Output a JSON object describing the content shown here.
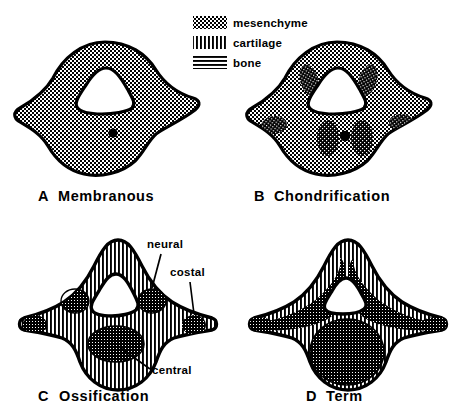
{
  "figure": {
    "background_color": "#ffffff",
    "ink_color": "#000000",
    "width": 467,
    "height": 419
  },
  "legend": {
    "items": [
      {
        "swatch": "checker-pattern-swatch",
        "label": "mesenchyme",
        "pattern": "mesenchyme"
      },
      {
        "swatch": "vertical-lines-swatch",
        "label": "cartilage",
        "pattern": "cartilage"
      },
      {
        "swatch": "horizontal-lines-swatch",
        "label": "bone",
        "pattern": "bone"
      }
    ]
  },
  "panels": [
    {
      "letter": "A",
      "caption": "Membranous",
      "fill": "mesenchyme",
      "features": [
        "neural-canal",
        "notochord-dot"
      ],
      "centers": []
    },
    {
      "letter": "B",
      "caption": "Chondrification",
      "fill": "mesenchyme",
      "features": [
        "neural-canal",
        "notochord-dot"
      ],
      "centers": [
        {
          "name": "neural",
          "side": "left"
        },
        {
          "name": "neural",
          "side": "right"
        },
        {
          "name": "costal",
          "side": "left"
        },
        {
          "name": "costal",
          "side": "right"
        },
        {
          "name": "central",
          "side": "mid"
        }
      ]
    },
    {
      "letter": "C",
      "caption": "Ossification",
      "fill": "cartilage",
      "features": [
        "neural-canal"
      ],
      "centers": [
        {
          "name": "neural",
          "side": "left"
        },
        {
          "name": "neural",
          "side": "right"
        },
        {
          "name": "costal",
          "side": "left"
        },
        {
          "name": "costal",
          "side": "right"
        },
        {
          "name": "central",
          "side": "mid"
        }
      ],
      "annotations": [
        {
          "label": "neural"
        },
        {
          "label": "costal"
        },
        {
          "label": "central"
        }
      ]
    },
    {
      "letter": "D",
      "caption": "Term",
      "fill": "cartilage",
      "features": [
        "neural-canal"
      ],
      "centers": [
        {
          "name": "neural",
          "side": "left"
        },
        {
          "name": "neural",
          "side": "right"
        },
        {
          "name": "costal",
          "side": "left"
        },
        {
          "name": "costal",
          "side": "right"
        },
        {
          "name": "central",
          "side": "mid"
        }
      ]
    }
  ]
}
